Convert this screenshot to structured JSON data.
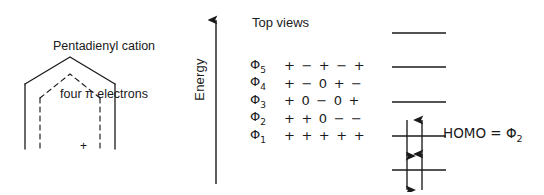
{
  "caption": {
    "line1": "Pentadienyl cation",
    "line2": "four π electrons"
  },
  "structure": {
    "charge_symbol": "+",
    "outer_style": "solid",
    "inner_style": "dashed"
  },
  "axis": {
    "energy_label": "Energy",
    "direction": "up"
  },
  "headings": {
    "top_views": "Top views"
  },
  "orbitals": [
    {
      "name": "Φ",
      "subscript": "5",
      "signs": "+ − + − +"
    },
    {
      "name": "Φ",
      "subscript": "4",
      "signs": "+ − 0 + −"
    },
    {
      "name": "Φ",
      "subscript": "3",
      "signs": "+ 0 − 0 +"
    },
    {
      "name": "Φ",
      "subscript": "2",
      "signs": "+ + 0 − −"
    },
    {
      "name": "Φ",
      "subscript": "1",
      "signs": "+ + + + +"
    }
  ],
  "energy_levels": [
    {
      "orbital": "Φ5",
      "electrons": 0
    },
    {
      "orbital": "Φ4",
      "electrons": 0
    },
    {
      "orbital": "Φ3",
      "electrons": 0
    },
    {
      "orbital": "Φ2",
      "electrons": 2
    },
    {
      "orbital": "Φ1",
      "electrons": 2
    }
  ],
  "annotation": {
    "homo_text": "HOMO = Φ",
    "homo_subscript": "2"
  },
  "colors": {
    "ink": "#1a1a1a",
    "background": "#ffffff"
  }
}
